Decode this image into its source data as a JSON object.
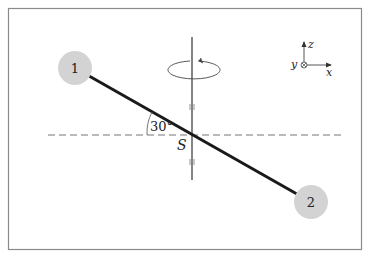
{
  "figure": {
    "bodies": [
      {
        "label": "1",
        "cx": 75,
        "cy": 68
      },
      {
        "label": "2",
        "cx": 311,
        "cy": 202
      }
    ],
    "center_label": "S",
    "angle_label": "30°",
    "axes": {
      "x": "x",
      "y": "y",
      "z": "z"
    },
    "colors": {
      "rod": "#1a1a1a",
      "body_fill": "#d3d3d3",
      "frame": "#888888",
      "line": "#555555"
    }
  }
}
